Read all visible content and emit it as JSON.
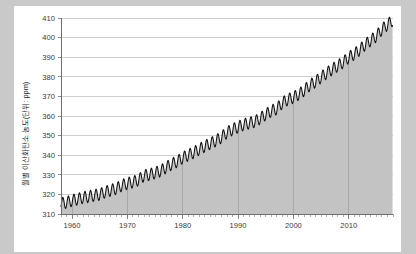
{
  "chart_data": {
    "type": "area",
    "title": "",
    "subtitle": "",
    "xlabel": "",
    "ylabel": "월별 이산화탄소 농도(단위: ppm)",
    "xlim": [
      1958,
      2018
    ],
    "ylim": [
      310,
      410
    ],
    "grid": true,
    "grid_axis": "both",
    "legend": false,
    "legend_position": "none",
    "series_name": "월별 이산화탄소 농도",
    "line_color": "#111111",
    "fill_color": "#c3c3c3",
    "x_ticks": [
      1960,
      1970,
      1980,
      1990,
      2000,
      2010
    ],
    "x_tick_labels": [
      "1960",
      "1970",
      "1980",
      "1990",
      "2000",
      "2010"
    ],
    "x_minor_tick_step": 1,
    "y_ticks": [
      310,
      320,
      330,
      340,
      350,
      360,
      370,
      380,
      390,
      400,
      410
    ],
    "y_tick_labels": [
      "310",
      "320",
      "330",
      "340",
      "350",
      "360",
      "370",
      "380",
      "390",
      "400",
      "410"
    ],
    "units": "ppm",
    "seasonal_amplitude_ppm": 3.0,
    "seasonal_peak_month": 5,
    "seasonal_trough_month": 9,
    "x": [
      1958,
      1959,
      1960,
      1961,
      1962,
      1963,
      1964,
      1965,
      1966,
      1967,
      1968,
      1969,
      1970,
      1971,
      1972,
      1973,
      1974,
      1975,
      1976,
      1977,
      1978,
      1979,
      1980,
      1981,
      1982,
      1983,
      1984,
      1985,
      1986,
      1987,
      1988,
      1989,
      1990,
      1991,
      1992,
      1993,
      1994,
      1995,
      1996,
      1997,
      1998,
      1999,
      2000,
      2001,
      2002,
      2003,
      2004,
      2005,
      2006,
      2007,
      2008,
      2009,
      2010,
      2011,
      2012,
      2013,
      2014,
      2015,
      2016,
      2017
    ],
    "annual_mean": [
      315.3,
      315.9,
      316.9,
      317.6,
      318.4,
      318.9,
      319.5,
      320.0,
      321.3,
      322.1,
      323.0,
      324.6,
      325.6,
      326.3,
      327.4,
      329.6,
      330.1,
      331.0,
      332.0,
      333.8,
      335.4,
      336.8,
      338.7,
      340.1,
      341.4,
      343.0,
      344.6,
      346.0,
      347.4,
      349.2,
      351.6,
      353.1,
      354.4,
      355.6,
      356.4,
      357.1,
      358.8,
      360.8,
      362.6,
      363.7,
      366.7,
      368.4,
      369.5,
      371.1,
      373.2,
      375.8,
      377.5,
      379.8,
      381.9,
      383.8,
      385.6,
      387.4,
      389.9,
      391.6,
      393.8,
      396.5,
      398.6,
      400.8,
      404.2,
      406.6
    ]
  },
  "axis_labels": {
    "y_axis_title": "월별 이산화탄소 농도(단위: ppm)"
  }
}
